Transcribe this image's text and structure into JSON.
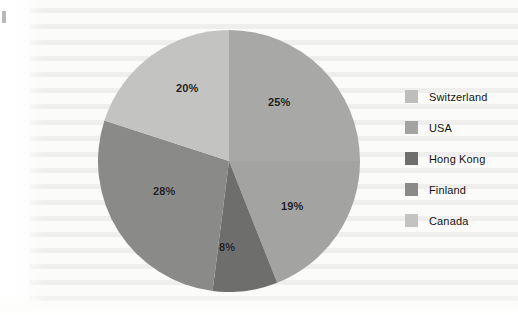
{
  "figure": {
    "background_color": "#fbfbfa",
    "edge_mark": "page-edge-artifact"
  },
  "chart_data": {
    "type": "pie",
    "title": "",
    "subtitle": "",
    "xlabel": "",
    "ylabel": "",
    "grid": false,
    "legend_position": "right",
    "start_angle_deg": 0,
    "direction": "clockwise",
    "categories": [
      "Switzerland",
      "USA",
      "Hong Kong",
      "Finland",
      "Canada"
    ],
    "values": [
      25,
      19,
      8,
      28,
      20
    ],
    "value_labels": [
      "25%",
      "19%",
      "8%",
      "28%",
      "20%"
    ],
    "colors": [
      "#a8a8a6",
      "#a3a3a1",
      "#6e6e6c",
      "#8a8a88",
      "#c3c3c1"
    ],
    "legend_swatch_colors": [
      "#bdbdbb",
      "#a3a3a1",
      "#6e6e6c",
      "#8a8a88",
      "#c3c3c1"
    ],
    "slices": [
      {
        "label": "Switzerland",
        "value": 25,
        "value_label": "25%",
        "color": "#a8a8a6",
        "start_deg": 0,
        "end_deg": 90,
        "label_x": 268,
        "label_y": 96
      },
      {
        "label": "USA",
        "value": 19,
        "value_label": "19%",
        "color": "#a3a3a1",
        "start_deg": 90,
        "end_deg": 158.4,
        "label_x": 281,
        "label_y": 200
      },
      {
        "label": "Hong Kong",
        "value": 8,
        "value_label": "8%",
        "color": "#6e6e6c",
        "start_deg": 158.4,
        "end_deg": 187.2,
        "label_x": 219,
        "label_y": 241
      },
      {
        "label": "Finland",
        "value": 28,
        "value_label": "28%",
        "color": "#8a8a88",
        "start_deg": 187.2,
        "end_deg": 288,
        "label_x": 153,
        "label_y": 185
      },
      {
        "label": "Canada",
        "value": 20,
        "value_label": "20%",
        "color": "#c3c3c1",
        "start_deg": 288,
        "end_deg": 360,
        "label_x": 176,
        "label_y": 82
      }
    ],
    "geometry": {
      "center_x": 229,
      "center_y": 161,
      "radius": 131
    }
  },
  "legend": {
    "items": [
      {
        "label": "Switzerland",
        "swatch_color": "#bdbdbb"
      },
      {
        "label": "USA",
        "swatch_color": "#a3a3a1"
      },
      {
        "label": "Hong Kong",
        "swatch_color": "#6e6e6c"
      },
      {
        "label": "Finland",
        "swatch_color": "#8a8a88"
      },
      {
        "label": "Canada",
        "swatch_color": "#c3c3c1"
      }
    ]
  }
}
